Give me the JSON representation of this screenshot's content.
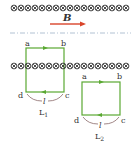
{
  "field": {
    "label": "B",
    "arrow_color": "#d9442a",
    "symbol": "cross-in-circle",
    "symbol_color": "#333333"
  },
  "wire_color": "#5aa832",
  "brace_color": "#8a6a6a",
  "loop1": {
    "name": "L",
    "subscript": "1",
    "corners": {
      "a": "a",
      "b": "b",
      "c": "c",
      "d": "d"
    },
    "length_label": "l"
  },
  "loop2": {
    "name": "L",
    "subscript": "2",
    "corners": {
      "a": "a",
      "b": "b",
      "c": "c",
      "d": "d"
    },
    "length_label": "l"
  }
}
